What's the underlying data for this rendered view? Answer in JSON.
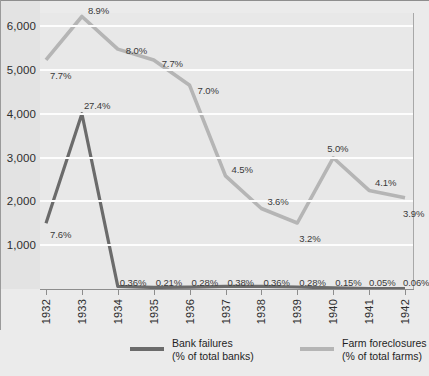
{
  "chart_data": {
    "type": "line",
    "title": "",
    "subtitle": "",
    "xlabel": "",
    "ylabel": "",
    "categories": [
      "1932",
      "1933",
      "1934",
      "1935",
      "1936",
      "1937",
      "1938",
      "1939",
      "1940",
      "1941",
      "1942"
    ],
    "ylim": [
      0,
      6300
    ],
    "yticks": [
      1000,
      2000,
      3000,
      4000,
      5000,
      6000
    ],
    "ytick_labels": [
      "1,000",
      "2,000",
      "3,000",
      "4,000",
      "5,000",
      "6,000"
    ],
    "grid": true,
    "legend_position": "bottom",
    "series": [
      {
        "name": "Bank failures",
        "units": "% of total banks",
        "color": "#6b6b6b",
        "axis": "left-count",
        "values": [
          1500,
          4000,
          60,
          35,
          45,
          62,
          59,
          46,
          25,
          9,
          10
        ],
        "labels": [
          "7.6%",
          "27.4%",
          "0.36%",
          "0.21%",
          "0.28%",
          "0.38%",
          "0.36%",
          "0.28%",
          "0.15%",
          "0.05%",
          "0.06%"
        ]
      },
      {
        "name": "Farm foreclosures",
        "units": "% of total farms",
        "color": "#b5b5b5",
        "axis": "percent",
        "values": [
          7.7,
          8.9,
          8.0,
          7.7,
          7.0,
          4.5,
          3.6,
          3.2,
          5.0,
          4.1,
          3.9
        ],
        "labels": [
          "7.7%",
          "8.9%",
          "8.0%",
          "7.7%",
          "7.0%",
          "4.5%",
          "3.6%",
          "3.2%",
          "5.0%",
          "4.1%",
          "3.9%"
        ]
      }
    ]
  },
  "legend": {
    "items": [
      {
        "name_line1": "Bank failures",
        "name_line2": "(% of total banks)",
        "color": "#6b6b6b"
      },
      {
        "name_line1": "Farm foreclosures",
        "name_line2": "(% of total farms)",
        "color": "#b5b5b5"
      }
    ]
  },
  "colors": {
    "background": "#ebebeb",
    "plot_background": "#e8e8e8",
    "gridline": "#fdfdfd",
    "axis": "#8d8d8d",
    "bank_failures": "#6b6b6b",
    "farm_foreclosures": "#b5b5b5",
    "text": "#2e2e2e"
  }
}
